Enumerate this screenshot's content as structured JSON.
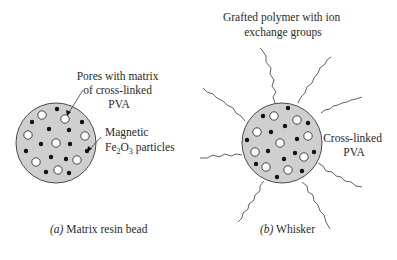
{
  "colors": {
    "bead_fill": "#cfcfcf",
    "bead_stroke": "#4a4a4a",
    "pore_fill": "#ffffff",
    "particle_fill": "#111111",
    "text": "#2a2a2a",
    "line": "#3a3a3a"
  },
  "panel_a": {
    "caption_prefix": "(a)",
    "caption_text": " Matrix resin bead",
    "label_pores": [
      "Pores with matrix",
      "of cross-linked",
      "PVA"
    ],
    "label_magnetic": "Magnetic",
    "label_fe_base": "Fe",
    "label_fe_sub1": "2",
    "label_fe_mid": "O",
    "label_fe_sub2": "3",
    "label_fe_rest": " particles"
  },
  "panel_b": {
    "caption_prefix": "(b)",
    "caption_text": " Whisker",
    "label_grafted": [
      "Grafted polymer with ion",
      "exchange groups"
    ],
    "label_crosslinked": [
      "Cross-linked",
      "PVA"
    ]
  }
}
